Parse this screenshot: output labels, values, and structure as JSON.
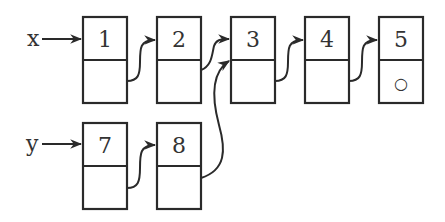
{
  "diagram": {
    "type": "linked-list",
    "pointers": [
      {
        "name": "x",
        "label": "x",
        "target": "node-1"
      },
      {
        "name": "y",
        "label": "y",
        "target": "node-7"
      }
    ],
    "nodes": [
      {
        "id": "node-1",
        "value": "1",
        "next": "node-2"
      },
      {
        "id": "node-2",
        "value": "2",
        "next": "node-3"
      },
      {
        "id": "node-3",
        "value": "3",
        "next": "node-4"
      },
      {
        "id": "node-4",
        "value": "4",
        "next": "node-5"
      },
      {
        "id": "node-5",
        "value": "5",
        "next": null,
        "null_symbol": "○"
      },
      {
        "id": "node-7",
        "value": "7",
        "next": "node-8"
      },
      {
        "id": "node-8",
        "value": "8",
        "next": "node-3"
      }
    ],
    "colors": {
      "stroke": "#2a2a2a",
      "text": "#333333",
      "background": "#ffffff"
    }
  }
}
